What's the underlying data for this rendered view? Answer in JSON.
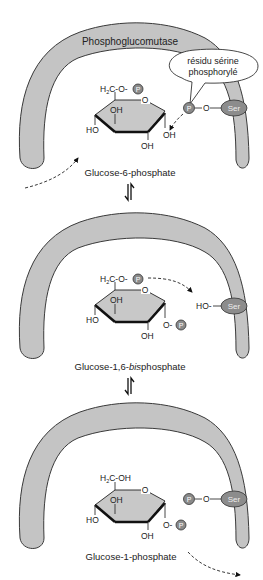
{
  "figure": {
    "enzyme_label": "Phosphoglucomutase",
    "bubble": {
      "line1": "résidu sérine",
      "line2": "phosphorylé"
    },
    "panels": [
      {
        "caption": "Glucose-6-phosphate",
        "c6_group": "H2C-O-P",
        "c1_group": "OH",
        "serine_state": "P-O-Ser"
      },
      {
        "caption_prefix": "Glucose-1,6-",
        "caption_italic": "bis",
        "caption_suffix": "phosphate",
        "c6_group": "H2C-O-P",
        "c1_group": "O-P",
        "serine_state": "HO-Ser"
      },
      {
        "caption": "Glucose-1-phosphate",
        "c6_group": "H2C-OH",
        "c1_group": "O-P",
        "serine_state": "P-O-Ser"
      }
    ],
    "labels": {
      "h": "H",
      "sub2": "2",
      "c_o": "C-O-",
      "c_oh": "C-OH",
      "o": "O",
      "oh": "OH",
      "ho": "HO",
      "o_dash": "O-",
      "ho_dash": "HO-",
      "p": "P",
      "ser": "Ser"
    },
    "equilibrium_symbol": "⇌",
    "colors": {
      "enzyme_fill": "#c4c4c4",
      "ring_fill": "#c8c8c8",
      "phosphate_fill": "#8a8a8a",
      "serine_fill": "#8c8c8c",
      "outline": "#333333"
    }
  }
}
